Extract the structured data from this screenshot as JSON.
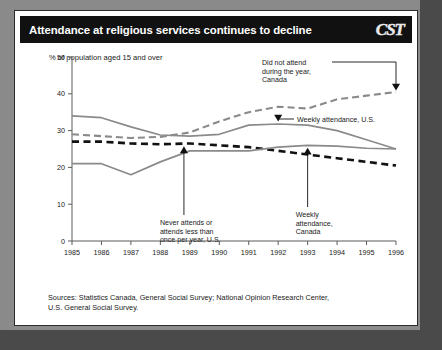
{
  "header": {
    "title": "Attendance at religious services continues to decline",
    "logo": "CST"
  },
  "subtitle": "% of population aged 15 and over",
  "sources": {
    "line1": "Sources: Statistics Canada, General Social Survey;  National Opinion Research Center,",
    "line2": "U.S. General Social Survey."
  },
  "colors": {
    "titlebar": "#111111",
    "card": "#ffffff",
    "outer": "#8c8c8c",
    "gray_series": "#8a8a8a",
    "black_series": "#111111",
    "axis": "#5a5a5a"
  },
  "chart_data": {
    "type": "line",
    "title": "Attendance at religious services continues to decline",
    "xlabel": "",
    "ylabel": "% of population aged 15 and over",
    "x": [
      1985,
      1986,
      1987,
      1988,
      1989,
      1990,
      1991,
      1992,
      1993,
      1994,
      1995,
      1996
    ],
    "categories": [
      "1985",
      "1986",
      "1987",
      "1988",
      "1989",
      "1990",
      "1991",
      "1992",
      "1993",
      "1994",
      "1995",
      "1996"
    ],
    "xlim": [
      1985,
      1996
    ],
    "ylim": [
      0,
      50
    ],
    "yticks": [
      0,
      10,
      20,
      30,
      40,
      50
    ],
    "grid": false,
    "legend": "annotations",
    "series": [
      {
        "name": "Did not attend during the year, Canada",
        "style": "dashed",
        "color": "#8a8a8a",
        "values": [
          29.0,
          28.5,
          28.0,
          28.3,
          29.5,
          32.5,
          35.0,
          36.5,
          36.0,
          38.5,
          39.5,
          40.5
        ]
      },
      {
        "name": "Weekly attendance, U.S.",
        "style": "solid",
        "color": "#8a8a8a",
        "values": [
          34.0,
          33.5,
          31.0,
          28.8,
          28.5,
          29.0,
          31.5,
          31.8,
          31.5,
          30.0,
          27.5,
          25.0
        ]
      },
      {
        "name": "Never attends or attends less than once per year, U.S.",
        "style": "dashed",
        "color": "#111111",
        "values": [
          27.0,
          27.0,
          26.5,
          26.3,
          26.5,
          26.0,
          25.5,
          24.5,
          23.5,
          22.5,
          21.5,
          20.5
        ]
      },
      {
        "name": "Weekly attendance, Canada",
        "style": "solid",
        "color": "#8a8a8a",
        "values": [
          21.0,
          21.0,
          18.0,
          21.5,
          24.5,
          24.5,
          24.5,
          25.5,
          26.0,
          25.8,
          25.2,
          25.0
        ]
      }
    ],
    "annotations": [
      {
        "id": "did-not-attend-canada",
        "label_lines": [
          "Did not attend",
          "during the year,",
          "Canada"
        ],
        "target_x": 1996,
        "target_y": 40.5
      },
      {
        "id": "weekly-attendance-us",
        "label_lines": [
          "Weekly attendance, U.S."
        ],
        "target_x": 1992,
        "target_y": 31.8
      },
      {
        "id": "never-attends-us",
        "label_lines": [
          "Never attends or",
          "attends less than",
          "once per year, U.S."
        ],
        "target_x": 1988.8,
        "target_y": 26.4
      },
      {
        "id": "weekly-attendance-canada",
        "label_lines": [
          "Weekly",
          "attendance,",
          "Canada"
        ],
        "target_x": 1993,
        "target_y": 26.0
      }
    ]
  }
}
